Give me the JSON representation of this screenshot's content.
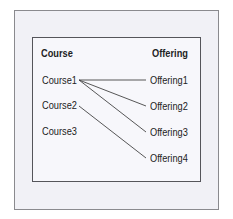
{
  "diagram": {
    "headers": {
      "left": "Course",
      "right": "Offering"
    },
    "courses": [
      "Course1",
      "Course2",
      "Course3"
    ],
    "offerings": [
      "Offering1",
      "Offering2",
      "Offering3",
      "Offering4"
    ],
    "links": [
      {
        "from": "Course1",
        "to": "Offering1"
      },
      {
        "from": "Course1",
        "to": "Offering2"
      },
      {
        "from": "Course1",
        "to": "Offering3"
      },
      {
        "from": "Course2",
        "to": "Offering4"
      }
    ],
    "colors": {
      "outer_bg": "#f1f1f6",
      "inner_bg": "#f7f7fb",
      "line": "#444444",
      "text": "#222222"
    }
  }
}
